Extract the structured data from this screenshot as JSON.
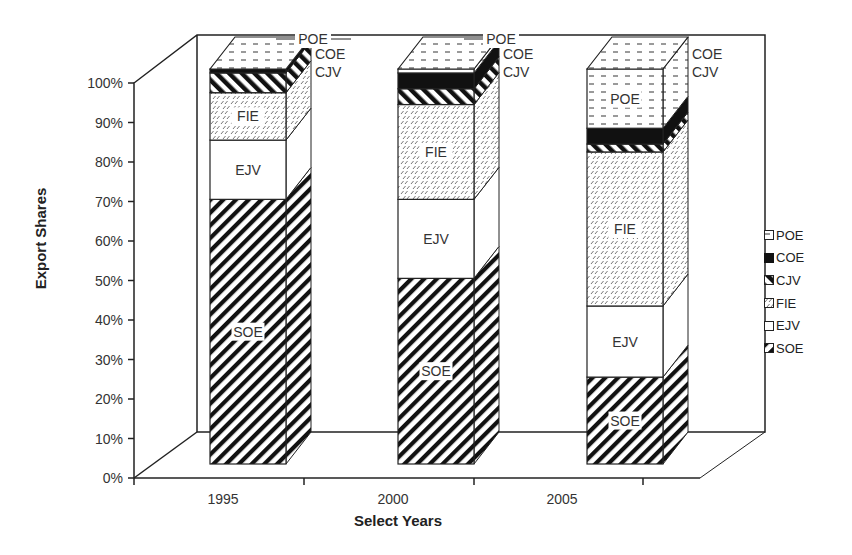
{
  "chart_data": {
    "type": "bar",
    "subtype": "stacked-100-3d",
    "title": "",
    "xlabel": "Select Years",
    "ylabel": "Export Shares",
    "categories": [
      "1995",
      "2000",
      "2005"
    ],
    "y_ticks": [
      "0%",
      "10%",
      "20%",
      "30%",
      "40%",
      "50%",
      "60%",
      "70%",
      "80%",
      "90%",
      "100%"
    ],
    "ylim": [
      0,
      100
    ],
    "grid": false,
    "legend_position": "right",
    "series": [
      {
        "name": "SOE",
        "values": [
          67,
          47,
          22
        ],
        "pattern": "wide-diagonal"
      },
      {
        "name": "EJV",
        "values": [
          15,
          20,
          18
        ],
        "pattern": "white"
      },
      {
        "name": "FIE",
        "values": [
          12,
          24,
          39
        ],
        "pattern": "light-dashed-diagonal"
      },
      {
        "name": "CJV",
        "values": [
          5,
          4,
          2
        ],
        "pattern": "bold-back-diagonal"
      },
      {
        "name": "COE",
        "values": [
          1,
          4,
          4
        ],
        "pattern": "solid-black"
      },
      {
        "name": "POE",
        "values": [
          0,
          1,
          15
        ],
        "pattern": "horizontal-dashes"
      }
    ],
    "annotations": [
      {
        "bar": "1995",
        "labels": [
          "SOE",
          "EJV",
          "FIE",
          "CJV",
          "COE",
          "POE"
        ]
      },
      {
        "bar": "2000",
        "labels": [
          "SOE",
          "EJV",
          "FIE",
          "CJV",
          "COE",
          "POE"
        ]
      },
      {
        "bar": "2005",
        "labels": [
          "SOE",
          "EJV",
          "FIE",
          "CJV",
          "COE",
          "POE"
        ]
      }
    ]
  },
  "axes": {
    "xlabel": "Select Years",
    "ylabel": "Export Shares"
  },
  "legend": {
    "items": [
      "POE",
      "COE",
      "CJV",
      "FIE",
      "EJV",
      "SOE"
    ]
  }
}
